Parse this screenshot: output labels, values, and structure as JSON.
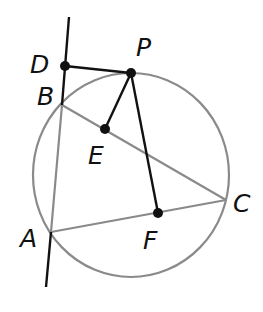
{
  "figure": {
    "colors": {
      "circle": "#8a8a8a",
      "triangle": "#8a8a8a",
      "black_lines": "#111111",
      "points": "#111111"
    },
    "circle": {
      "cx": 131,
      "cy": 175,
      "rx": 98,
      "ry": 102
    },
    "points": {
      "D": {
        "x": 65,
        "y": 66,
        "label": "D",
        "label_x": 30,
        "label_y": 52
      },
      "P": {
        "x": 131,
        "y": 73,
        "label": "P",
        "label_x": 136,
        "label_y": 35
      },
      "B": {
        "x": 62,
        "y": 105,
        "label": "B",
        "label_x": 37,
        "label_y": 84
      },
      "E": {
        "x": 105,
        "y": 129,
        "label": "E",
        "label_x": 88,
        "label_y": 143
      },
      "A": {
        "x": 51,
        "y": 232,
        "label": "A",
        "label_x": 20,
        "label_y": 226
      },
      "F": {
        "x": 158,
        "y": 213,
        "label": "F",
        "label_x": 143,
        "label_y": 228
      },
      "C": {
        "x": 226,
        "y": 200,
        "label": "C",
        "label_x": 233,
        "label_y": 191
      }
    },
    "line_AB_extended": {
      "x1": 69,
      "y1": 17,
      "x2": 46,
      "y2": 287
    },
    "segments_black": [
      "DP",
      "PE",
      "PF"
    ],
    "segments_gray": [
      "AB",
      "BC",
      "AC"
    ],
    "dots": [
      "D",
      "P",
      "E",
      "F"
    ]
  }
}
